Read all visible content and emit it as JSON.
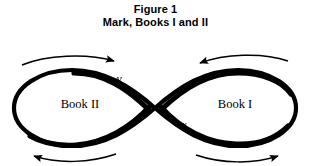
{
  "figure": {
    "caption": {
      "line1": "Figure 1",
      "line2": "Mark, Books I and II"
    },
    "diagram": {
      "type": "lemniscate-flow-diagram",
      "shape": "figure-eight",
      "crossing_point": {
        "x": 155,
        "y": 108
      },
      "lobes": [
        {
          "id": "left",
          "label": "Book II",
          "label_position": {
            "x": 80,
            "y": 104
          },
          "flow_direction": "clockwise"
        },
        {
          "id": "right",
          "label": "Book I",
          "label_position": {
            "x": 235,
            "y": 104
          },
          "flow_direction": "counter-clockwise"
        }
      ],
      "point_labels": [
        {
          "name": "y",
          "text": "y",
          "x": 119,
          "y": 79
        },
        {
          "name": "x",
          "text": "x",
          "x": 184,
          "y": 125
        }
      ],
      "flow_arrows": [
        {
          "name": "top-left-arrow",
          "lobe": "left",
          "direction": "right",
          "position": "above"
        },
        {
          "name": "bottom-left-arrow",
          "lobe": "left",
          "direction": "left",
          "position": "below"
        },
        {
          "name": "top-right-arrow",
          "lobe": "right",
          "direction": "left",
          "position": "above"
        },
        {
          "name": "bottom-right-arrow",
          "lobe": "right",
          "direction": "right",
          "position": "below"
        }
      ],
      "colors": {
        "stroke": "#000000",
        "background": "#ffffff",
        "text": "#000000"
      }
    }
  }
}
